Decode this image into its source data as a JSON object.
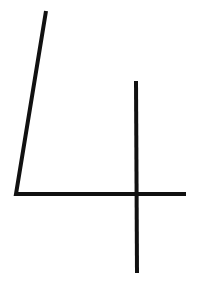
{
  "image": {
    "description": "Hand-drawn digit",
    "digit": "4",
    "background_color": "#ffffff",
    "stroke_color": "#111111"
  }
}
